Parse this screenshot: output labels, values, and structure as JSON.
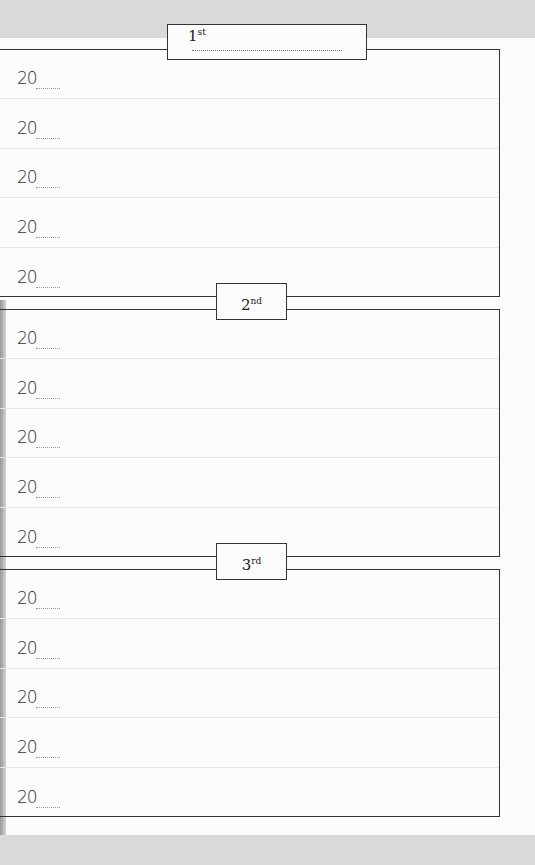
{
  "sections": [
    {
      "label": "1",
      "suffix": "st",
      "rows": [
        "20",
        "20",
        "20",
        "20",
        "20"
      ]
    },
    {
      "label": "2",
      "suffix": "nd",
      "rows": [
        "20",
        "20",
        "20",
        "20",
        "20"
      ]
    },
    {
      "label": "3",
      "suffix": "rd",
      "rows": [
        "20",
        "20",
        "20",
        "20",
        "20"
      ]
    }
  ],
  "colors": {
    "line": "#333333",
    "paper": "#fbfbfb",
    "background": "#d9d9d9"
  }
}
